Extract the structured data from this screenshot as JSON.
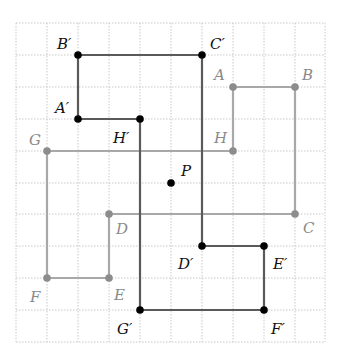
{
  "grid": {
    "left": 16,
    "top": 23,
    "dx": 30.9,
    "dy": 31.9,
    "cols": 10,
    "rows": 10,
    "color": "#c8c8c8"
  },
  "colors": {
    "original": "#9a9a9a",
    "image": "#555555",
    "image_point": "#000000",
    "label_original": "#8a8a8a",
    "label_image": "#111111"
  },
  "center": {
    "label": "P",
    "gx": 5,
    "gy": 5
  },
  "original": {
    "points": [
      {
        "label": "A",
        "gx": 7,
        "gy": 2
      },
      {
        "label": "B",
        "gx": 9,
        "gy": 2
      },
      {
        "label": "C",
        "gx": 9,
        "gy": 6
      },
      {
        "label": "D",
        "gx": 3,
        "gy": 6
      },
      {
        "label": "E",
        "gx": 3,
        "gy": 8
      },
      {
        "label": "F",
        "gx": 1,
        "gy": 8
      },
      {
        "label": "G",
        "gx": 1,
        "gy": 4
      },
      {
        "label": "H",
        "gx": 7,
        "gy": 4
      }
    ]
  },
  "image": {
    "points": [
      {
        "label": "A′",
        "gx": 2,
        "gy": 3
      },
      {
        "label": "B′",
        "gx": 2,
        "gy": 1
      },
      {
        "label": "C′",
        "gx": 6,
        "gy": 1
      },
      {
        "label": "D′",
        "gx": 6,
        "gy": 7
      },
      {
        "label": "E′",
        "gx": 8,
        "gy": 7
      },
      {
        "label": "F′",
        "gx": 8,
        "gy": 9
      },
      {
        "label": "G′",
        "gx": 4,
        "gy": 9
      },
      {
        "label": "H′",
        "gx": 4,
        "gy": 3
      }
    ]
  },
  "labels": {
    "A": "A",
    "B": "B",
    "C": "C",
    "D": "D",
    "E": "E",
    "F": "F",
    "G": "G",
    "H": "H",
    "P": "P",
    "A_p": "A′",
    "B_p": "B′",
    "C_p": "C′",
    "D_p": "D′",
    "E_p": "E′",
    "F_p": "F′",
    "G_p": "G′",
    "H_p": "H′"
  }
}
